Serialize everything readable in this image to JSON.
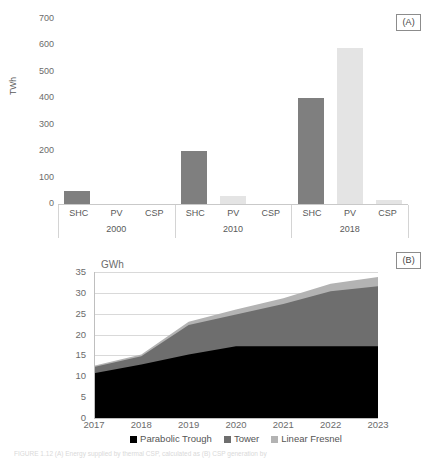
{
  "figure": {
    "panel_a_tag": "(A)",
    "panel_b_tag": "(B)",
    "caption": "FIGURE 1.12   (A) Energy supplied by thermal CSP, calculated as (B) CSP generation by"
  },
  "chart_data": [
    {
      "id": "panel-a",
      "type": "bar",
      "title": "",
      "xlabel": "",
      "ylabel": "TWh",
      "ylim": [
        0,
        700
      ],
      "yticks": [
        0,
        100,
        200,
        300,
        400,
        500,
        600,
        700
      ],
      "grid": false,
      "legend": "none",
      "groups": [
        "2000",
        "2010",
        "2018"
      ],
      "categories": [
        "SHC",
        "PV",
        "CSP"
      ],
      "series": [
        {
          "name": "2000",
          "values": [
            50,
            0,
            0
          ]
        },
        {
          "name": "2010",
          "values": [
            200,
            30,
            0
          ]
        },
        {
          "name": "2018",
          "values": [
            400,
            590,
            15
          ]
        }
      ],
      "colors": {
        "SHC": "#7f7f7f",
        "PV": "#e4e4e4",
        "CSP": "#e4e4e4"
      }
    },
    {
      "id": "panel-b",
      "type": "area",
      "stacked": true,
      "title": "",
      "xlabel": "",
      "ylabel": "GWh",
      "unit_label": "GWh",
      "ylim": [
        0,
        35
      ],
      "yticks": [
        0,
        5,
        10,
        15,
        20,
        25,
        30,
        35
      ],
      "grid": true,
      "legend_position": "bottom",
      "x": [
        "2017",
        "2018",
        "2019",
        "2020",
        "2021",
        "2022",
        "2023"
      ],
      "series": [
        {
          "name": "Parabolic Trough",
          "color": "#000000",
          "values": [
            10.7,
            12.8,
            15.2,
            17.2,
            17.2,
            17.2,
            17.2
          ]
        },
        {
          "name": "Tower",
          "color": "#6e6e6e",
          "values": [
            1.5,
            2.0,
            7.1,
            7.6,
            10.1,
            13.2,
            14.4
          ]
        },
        {
          "name": "Linear Fresnel",
          "color": "#b3b3b3",
          "values": [
            0.3,
            0.4,
            0.8,
            1.2,
            1.4,
            1.8,
            2.2
          ]
        }
      ],
      "totals": [
        12.5,
        15.2,
        23.1,
        26.0,
        28.7,
        32.2,
        33.8
      ]
    }
  ],
  "panel_a": {
    "tag": "(A)",
    "y_axis_label": "TWh",
    "y_ticks": [
      "700",
      "600",
      "500",
      "400",
      "300",
      "200",
      "100",
      "0"
    ],
    "groups": [
      {
        "label": "2000",
        "categories": [
          {
            "label": "SHC",
            "value": 50
          },
          {
            "label": "PV",
            "value": 0
          },
          {
            "label": "CSP",
            "value": 0
          }
        ]
      },
      {
        "label": "2010",
        "categories": [
          {
            "label": "SHC",
            "value": 200
          },
          {
            "label": "PV",
            "value": 30
          },
          {
            "label": "CSP",
            "value": 0
          }
        ]
      },
      {
        "label": "2018",
        "categories": [
          {
            "label": "SHC",
            "value": 400
          },
          {
            "label": "PV",
            "value": 590
          },
          {
            "label": "CSP",
            "value": 15
          }
        ]
      }
    ]
  },
  "panel_b": {
    "tag": "(B)",
    "unit_label": "GWh",
    "y_ticks": [
      "35",
      "30",
      "25",
      "20",
      "15",
      "10",
      "5",
      "0"
    ],
    "x_ticks": [
      "2017",
      "2018",
      "2019",
      "2020",
      "2021",
      "2022",
      "2023"
    ],
    "legend": [
      {
        "label": "Parabolic Trough",
        "color": "#000000"
      },
      {
        "label": "Tower",
        "color": "#6e6e6e"
      },
      {
        "label": "Linear Fresnel",
        "color": "#b3b3b3"
      }
    ]
  }
}
